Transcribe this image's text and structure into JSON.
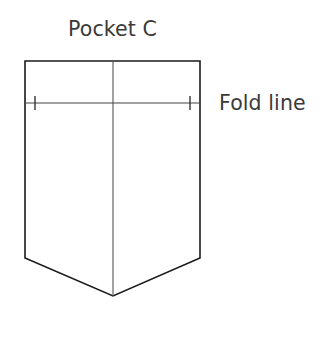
{
  "diagram": {
    "title": "Pocket C",
    "annotations": {
      "fold_line": "Fold line"
    },
    "colors": {
      "background": "#ffffff",
      "outline": "#1a1a1a",
      "center_line": "#555555",
      "fold_line": "#444444",
      "text": "#3a3a3a"
    },
    "geometry": {
      "outline_points": "25,61 200,61 200,258 113,296 25,258",
      "center_line": {
        "x": 113,
        "y1": 61,
        "y2": 296
      },
      "fold_line": {
        "x1": 25,
        "x2": 200,
        "y": 103
      },
      "tick_marks": [
        {
          "x": 35,
          "y1": 96,
          "y2": 110
        },
        {
          "x": 190,
          "y1": 96,
          "y2": 110
        }
      ]
    }
  }
}
